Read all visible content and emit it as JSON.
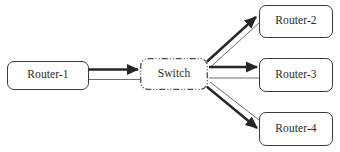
{
  "diagram": {
    "type": "network-topology",
    "background_color": "#ffffff",
    "line_color_thick": "#262626",
    "line_color_thin": "#6e6e6e",
    "node_border_color": "#3a3a3a",
    "switch_border_color": "#4a4a4a",
    "text_color": "#2b2b2b",
    "nodes": [
      {
        "id": "router-1",
        "label": "Router-1",
        "shape": "rounded-rect",
        "border_style": "solid"
      },
      {
        "id": "switch",
        "label": "Switch",
        "shape": "rounded-rect",
        "border_style": "dash-dot-dot"
      },
      {
        "id": "router-2",
        "label": "Router-2",
        "shape": "rounded-rect",
        "border_style": "solid"
      },
      {
        "id": "router-3",
        "label": "Router-3",
        "shape": "rounded-rect",
        "border_style": "solid"
      },
      {
        "id": "router-4",
        "label": "Router-4",
        "shape": "rounded-rect",
        "border_style": "solid"
      }
    ],
    "edges": [
      {
        "id": "edge-router1-switch-out",
        "from": "router-1",
        "to": "switch",
        "weight": "thick",
        "arrow": true,
        "direction": "to-switch"
      },
      {
        "id": "edge-router1-switch-in",
        "from": "switch",
        "to": "router-1",
        "weight": "thin",
        "arrow": false,
        "direction": "return"
      },
      {
        "id": "edge-switch-router2-out",
        "from": "switch",
        "to": "router-2",
        "weight": "thick",
        "arrow": true,
        "direction": "to-router"
      },
      {
        "id": "edge-switch-router2-in",
        "from": "router-2",
        "to": "switch",
        "weight": "thin",
        "arrow": false,
        "direction": "return"
      },
      {
        "id": "edge-switch-router3-out",
        "from": "switch",
        "to": "router-3",
        "weight": "thick",
        "arrow": true,
        "direction": "to-router"
      },
      {
        "id": "edge-switch-router3-in",
        "from": "router-3",
        "to": "switch",
        "weight": "thin",
        "arrow": false,
        "direction": "return"
      },
      {
        "id": "edge-switch-router4-out",
        "from": "switch",
        "to": "router-4",
        "weight": "thick",
        "arrow": true,
        "direction": "to-router"
      },
      {
        "id": "edge-switch-router4-in",
        "from": "router-4",
        "to": "switch",
        "weight": "thin",
        "arrow": false,
        "direction": "return"
      }
    ]
  }
}
